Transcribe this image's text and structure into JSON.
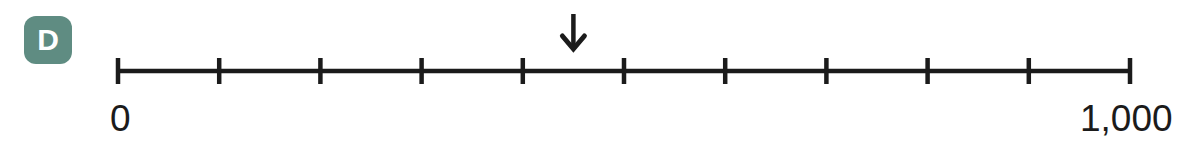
{
  "badge": {
    "letter": "D",
    "color": "#5f8c82",
    "text_color": "#ffffff"
  },
  "chart_data": {
    "type": "numberline",
    "title": "",
    "xlabel": "",
    "ylabel": "",
    "min": 0,
    "max": 1000,
    "min_label": "0",
    "max_label": "1,000",
    "tick_count": 11,
    "tick_interval": 100,
    "tick_values": [
      0,
      100,
      200,
      300,
      400,
      500,
      600,
      700,
      800,
      900,
      1000
    ],
    "tick_labels": [
      "0",
      "",
      "",
      "",
      "",
      "",
      "",
      "",
      "",
      "",
      "1,000"
    ],
    "marker": {
      "type": "down-arrow",
      "value": 450,
      "label": ""
    },
    "line_color": "#1b1b1b",
    "grid": false,
    "legend": "none"
  },
  "geometry": {
    "line_left_px": 118,
    "line_right_px": 1130,
    "line_y_px": 71,
    "tick_half_height_px": 13,
    "arrow_x_px": 572,
    "arrow_top_px": 14,
    "arrow_tip_px": 49
  }
}
